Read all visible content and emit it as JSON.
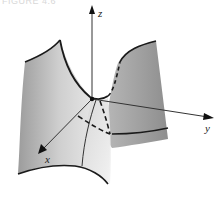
{
  "figure": {
    "caption": "FIGURE 4.6",
    "axes": {
      "x_label": "x",
      "y_label": "y",
      "z_label": "z"
    },
    "colors": {
      "surface_light": "#e6e6e6",
      "surface_mid": "#c4c4c4",
      "surface_dark": "#9a9a9a",
      "edge": "#1a1a1a",
      "axis": "#333333"
    }
  }
}
